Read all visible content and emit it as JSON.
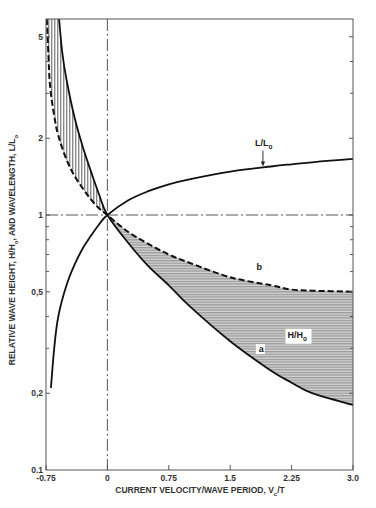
{
  "chart_data": {
    "type": "line",
    "title": "",
    "xlabel": "CURRENT VELOCITY/WAVE PERIOD, V_c/T",
    "xlabel_main": "CURRENT VELOCITY/WAVE PERIOD, V",
    "xlabel_sub": "c",
    "xlabel_tail": "/T",
    "ylabel": "RELATIVE WAVE HEIGHT, H/H_o, AND WAVELENGTH, L/L_o",
    "ylabel_parts": [
      "RELATIVE WAVE HEIGHT, H/H",
      "o",
      ", AND WAVELENGTH, L/L",
      "o"
    ],
    "xlim": [
      -0.75,
      3.0
    ],
    "ylim": [
      0.1,
      5.87
    ],
    "yscale": "log",
    "grid": false,
    "x_ticks": [
      {
        "value": -0.75,
        "label": "-0.75"
      },
      {
        "value": 0,
        "label": "0"
      },
      {
        "value": 0.75,
        "label": "0.75"
      },
      {
        "value": 1.5,
        "label": "1.5"
      },
      {
        "value": 2.25,
        "label": "2.25"
      },
      {
        "value": 3.0,
        "label": "3.0"
      }
    ],
    "y_ticks_labeled": [
      {
        "value": 0.1,
        "label": "0.1"
      },
      {
        "value": 0.2,
        "label": "0,2"
      },
      {
        "value": 0.5,
        "label": "0,5"
      },
      {
        "value": 1,
        "label": "1"
      },
      {
        "value": 2,
        "label": "2"
      },
      {
        "value": 5,
        "label": "5"
      }
    ],
    "y_ticks_minor": [
      0.3,
      0.4,
      0.6,
      0.7,
      0.8,
      0.9,
      3,
      4
    ],
    "reference_lines": [
      {
        "orientation": "horizontal",
        "value": 1,
        "style": "dash-dot"
      },
      {
        "orientation": "vertical",
        "value": 0,
        "style": "dash-dot"
      }
    ],
    "series": [
      {
        "name": "L/L_o",
        "label_main": "L/L",
        "label_sub": "o",
        "style": "solid",
        "x": [
          -0.69,
          -0.65,
          -0.6,
          -0.5,
          -0.4,
          -0.3,
          -0.2,
          -0.1,
          0,
          0.25,
          0.5,
          0.75,
          1.0,
          1.5,
          2.0,
          2.25,
          2.5,
          3.0
        ],
        "values": [
          0.21,
          0.3,
          0.4,
          0.53,
          0.64,
          0.74,
          0.83,
          0.92,
          1.0,
          1.14,
          1.24,
          1.32,
          1.38,
          1.48,
          1.55,
          1.58,
          1.61,
          1.66
        ]
      },
      {
        "name": "a",
        "style": "solid",
        "x": [
          -0.59,
          -0.55,
          -0.5,
          -0.4,
          -0.3,
          -0.2,
          -0.1,
          0,
          0.25,
          0.5,
          0.75,
          1.0,
          1.5,
          2.0,
          2.25,
          2.5,
          3.0
        ],
        "values": [
          5.87,
          4.3,
          3.4,
          2.4,
          1.85,
          1.48,
          1.2,
          1.0,
          0.78,
          0.63,
          0.53,
          0.44,
          0.32,
          0.245,
          0.22,
          0.2,
          0.18
        ]
      },
      {
        "name": "b",
        "style": "dashed",
        "x": [
          -0.74,
          -0.72,
          -0.7,
          -0.65,
          -0.6,
          -0.5,
          -0.4,
          -0.3,
          -0.2,
          -0.1,
          0,
          0.25,
          0.5,
          0.75,
          1.0,
          1.5,
          2.0,
          2.25,
          2.5,
          3.0
        ],
        "values": [
          5.87,
          4.2,
          3.2,
          2.45,
          2.05,
          1.65,
          1.42,
          1.27,
          1.15,
          1.06,
          1.0,
          0.86,
          0.77,
          0.7,
          0.65,
          0.57,
          0.53,
          0.51,
          0.505,
          0.5
        ]
      }
    ],
    "shaded_regions": [
      {
        "between": [
          "a",
          "b"
        ],
        "x_range": [
          -0.75,
          0
        ],
        "hatch": "vertical"
      },
      {
        "between": [
          "a",
          "b"
        ],
        "x_range": [
          0,
          3.0
        ],
        "hatch": "horizontal",
        "label": "H/H_o"
      }
    ],
    "annotations": [
      {
        "text": "L/L_o",
        "main": "L/L",
        "sub": "o",
        "arrow_to_x": 1.9,
        "arrow_to_series": "L/L_o"
      },
      {
        "text": "H/H_o",
        "main": "H/H",
        "sub": "o",
        "x": 2.2,
        "y": 0.33
      },
      {
        "text": "a",
        "x": 1.85,
        "y": 0.29
      },
      {
        "text": "b",
        "x": 1.82,
        "y": 0.61
      }
    ]
  }
}
